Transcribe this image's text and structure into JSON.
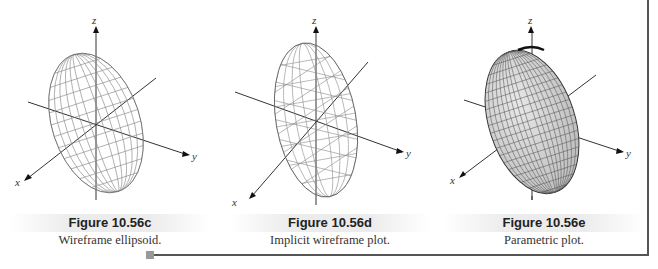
{
  "figures": [
    {
      "id": "c",
      "title": "Figure 10.56c",
      "caption": "Wireframe ellipsoid.",
      "style": "wireframe",
      "axes": {
        "x": "x",
        "y": "y",
        "z": "z"
      }
    },
    {
      "id": "d",
      "title": "Figure 10.56d",
      "caption": "Implicit wireframe plot.",
      "style": "implicit-wireframe",
      "axes": {
        "x": "x",
        "y": "y",
        "z": "z"
      }
    },
    {
      "id": "e",
      "title": "Figure 10.56e",
      "caption": "Parametric plot.",
      "style": "parametric-surface",
      "axes": {
        "x": "x",
        "y": "y",
        "z": "z"
      }
    }
  ],
  "colors": {
    "frame": "#555555",
    "marker": "#999999",
    "surface_fill": "#d9d9d9",
    "wire": "#777777"
  }
}
